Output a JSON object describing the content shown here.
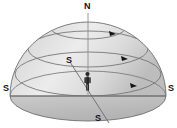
{
  "figure": {
    "type": "diagram",
    "background_color": "#ffffff",
    "dome": {
      "fill_light": "#e9e9e9",
      "fill_mid": "#d4d4d4",
      "fill_dark": "#bdbdbd",
      "outline_color": "#6e6e6e",
      "base_fill": "#c9c9c9",
      "center_x": 88,
      "base_y": 97,
      "radius_x": 78,
      "radius_y": 74,
      "base_ellipse_ry": 25
    },
    "labels": [
      {
        "id": "north-pole",
        "text": "N",
        "x": 84,
        "y": 2
      },
      {
        "id": "south-west-horizon",
        "text": "S",
        "x": 3,
        "y": 84
      },
      {
        "id": "south-east-horizon",
        "text": "S",
        "x": 168,
        "y": 84
      },
      {
        "id": "meridian-upper",
        "text": "S",
        "x": 66,
        "y": 56
      },
      {
        "id": "meridian-lower",
        "text": "S",
        "x": 95,
        "y": 114
      }
    ],
    "star_paths": [
      {
        "id": "circumpolar-path-upper",
        "cx": 88,
        "cy": 27,
        "rx": 38,
        "ry": 12,
        "arrow_x": 112,
        "arrow_y": 34
      },
      {
        "id": "star-path-middle",
        "cx": 88,
        "cy": 49,
        "rx": 60,
        "ry": 18,
        "arrow_x": 124,
        "arrow_y": 60
      },
      {
        "id": "star-path-lower",
        "cx": 88,
        "cy": 74,
        "rx": 73,
        "ry": 22,
        "arrow_x": 133,
        "arrow_y": 86
      }
    ],
    "axis": {
      "id": "polar-axis",
      "x1": 88,
      "y1": 12,
      "x2": 88,
      "y2": 97,
      "color": "#8a8a8a"
    },
    "meridian_line": {
      "id": "meridian-diagonal",
      "x1": 70,
      "y1": 62,
      "x2": 108,
      "y2": 122,
      "color": "#6e6e6e"
    },
    "horizon_line": {
      "id": "horizon-east-west",
      "x1": 10,
      "y1": 96,
      "x2": 166,
      "y2": 96,
      "color": "#6e6e6e"
    },
    "observer": {
      "id": "observer-figure",
      "x": 87,
      "y": 72,
      "height": 19,
      "color": "#2b2b2b"
    },
    "arrow_color": "#1a1a1a",
    "arrow_count": 3
  }
}
